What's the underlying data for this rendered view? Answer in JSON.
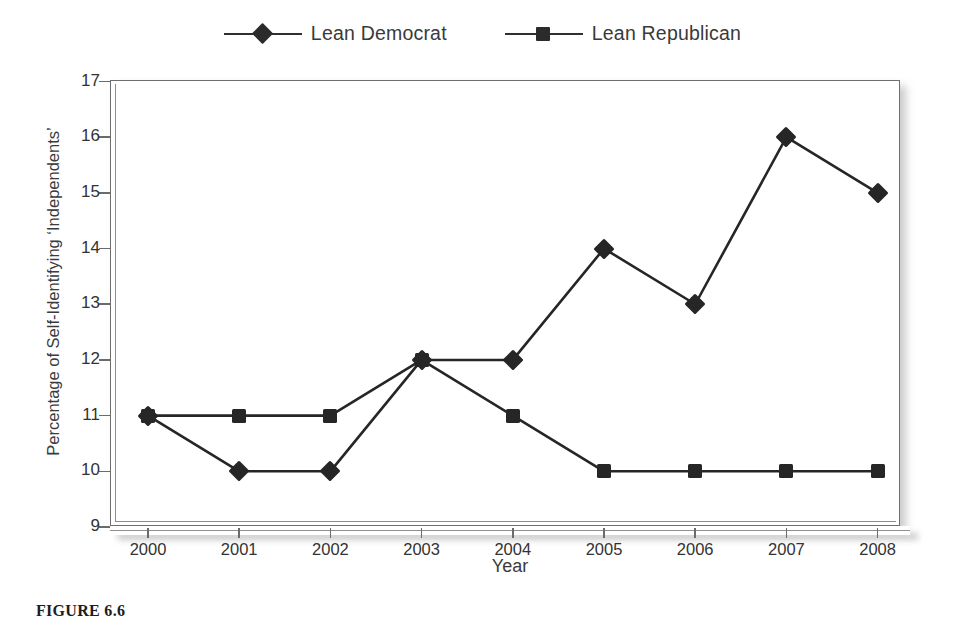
{
  "chart_data": {
    "type": "line",
    "title": "",
    "xlabel": "Year",
    "ylabel": "Percentage of Self-Identifying ‘Independents’",
    "categories": [
      "2000",
      "2001",
      "2002",
      "2003",
      "2004",
      "2005",
      "2006",
      "2007",
      "2008"
    ],
    "x": [
      2000,
      2001,
      2002,
      2003,
      2004,
      2005,
      2006,
      2007,
      2008
    ],
    "series": [
      {
        "name": "Lean Democrat",
        "marker": "diamond",
        "color": "#262626",
        "values": [
          11,
          10,
          10,
          12,
          12,
          14,
          13,
          16,
          15
        ]
      },
      {
        "name": "Lean Republican",
        "marker": "square",
        "color": "#262626",
        "values": [
          11,
          11,
          11,
          12,
          11,
          10,
          10,
          10,
          10
        ]
      }
    ],
    "ylim": [
      9,
      17
    ],
    "yticks": [
      "9",
      "10",
      "11",
      "12",
      "13",
      "14",
      "15",
      "16",
      "17"
    ],
    "grid": false,
    "legend_position": "top"
  },
  "legend": {
    "items": [
      {
        "label": "Lean Democrat",
        "marker": "diamond-marker-icon"
      },
      {
        "label": "Lean Republican",
        "marker": "square-marker-icon"
      }
    ]
  },
  "axes": {
    "x_title": "Year",
    "y_title": "Percentage of Self-Identifying ‘Independents’"
  },
  "caption": {
    "figure_number": "FIGURE 6.6",
    "text": ""
  }
}
